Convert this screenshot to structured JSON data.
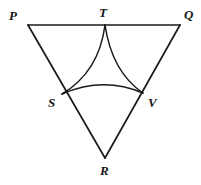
{
  "figure": {
    "type": "geometry-diagram",
    "background_color": "#ffffff",
    "stroke_color": "#1a1a1a",
    "canvas": {
      "width": 201,
      "height": 185
    },
    "labels": [
      {
        "id": "P",
        "text": "P",
        "x": 9,
        "y": 9,
        "point": {
          "x": 28,
          "y": 25
        }
      },
      {
        "id": "T",
        "text": "T",
        "x": 99,
        "y": 6,
        "point": {
          "x": 105,
          "y": 25
        }
      },
      {
        "id": "Q",
        "text": "Q",
        "x": 184,
        "y": 8,
        "point": {
          "x": 180,
          "y": 25
        }
      },
      {
        "id": "S",
        "text": "S",
        "x": 48,
        "y": 96,
        "point": {
          "x": 62,
          "y": 94
        }
      },
      {
        "id": "V",
        "text": "V",
        "x": 148,
        "y": 96,
        "point": {
          "x": 143,
          "y": 93
        }
      },
      {
        "id": "R",
        "text": "R",
        "x": 100,
        "y": 164,
        "point": {
          "x": 105,
          "y": 158
        }
      }
    ],
    "segments": [
      {
        "id": "PQ",
        "from": "P",
        "to": "Q",
        "d": "M 28 25 L 180 25"
      },
      {
        "id": "PR",
        "from": "P",
        "to": "R",
        "d": "M 28 25 L 105 158"
      },
      {
        "id": "QR",
        "from": "Q",
        "to": "R",
        "d": "M 180 25 L 105 158"
      }
    ],
    "arcs": [
      {
        "id": "TS",
        "from": "T",
        "to": "S",
        "bulge": "right",
        "d": "M 105 25 Q 99 72 62 94"
      },
      {
        "id": "SV",
        "from": "S",
        "to": "V",
        "bulge": "up",
        "d": "M 62 94 Q 103 76 143 93"
      },
      {
        "id": "TV",
        "from": "T",
        "to": "V",
        "bulge": "left",
        "d": "M 105 25 Q 112 72 143 93"
      }
    ]
  }
}
